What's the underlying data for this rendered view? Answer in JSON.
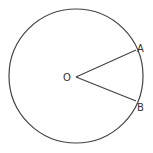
{
  "diagram": {
    "title": "",
    "shape": "circle-with-sector",
    "stroke_color": "#444444",
    "labels": {
      "center": "O",
      "point_a": "A",
      "point_b": "B"
    }
  }
}
